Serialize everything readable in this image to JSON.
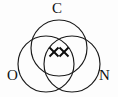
{
  "figure": {
    "background_color": "#fdfdfd",
    "stroke_color": "#1a1a1a",
    "mark_color": "#0d0d0d"
  },
  "labels": {
    "top": "C",
    "bottom_left": "O",
    "bottom_right": "N"
  },
  "sets": [
    {
      "id": "c",
      "label": "C",
      "cx": 59,
      "cy": 48,
      "r": 28
    },
    {
      "id": "o",
      "label": "O",
      "cx": 46,
      "cy": 64,
      "r": 28
    },
    {
      "id": "n",
      "label": "N",
      "cx": 72,
      "cy": 64,
      "r": 28
    }
  ],
  "marks": [
    {
      "id": "x-mark-left",
      "symbol": "x",
      "cx": 54,
      "cy": 52,
      "size": 9
    },
    {
      "id": "x-mark-right",
      "symbol": "x",
      "cx": 64,
      "cy": 52,
      "size": 9
    }
  ],
  "mark_count": "2"
}
